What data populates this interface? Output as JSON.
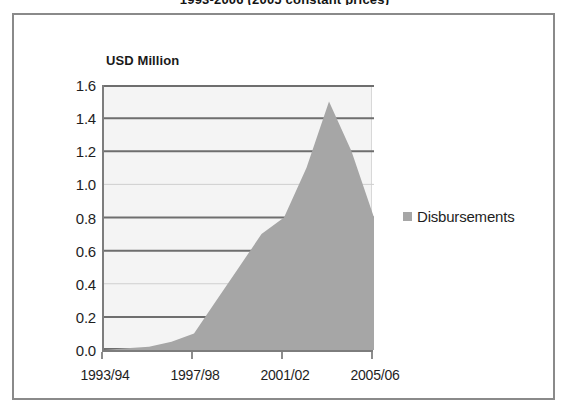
{
  "chart_data": {
    "type": "area",
    "title": "1993-2006 (2005 constant prices)",
    "ylabel": "USD Million",
    "xlabel": "",
    "ylim": [
      0.0,
      1.6
    ],
    "ytick_values": [
      1.6,
      1.4,
      1.2,
      1.0,
      0.8,
      0.6,
      0.4,
      0.2,
      0.0
    ],
    "ytick_labels": [
      "1.6",
      "1.4",
      "1.2",
      "1.0",
      "0.8",
      "0.6",
      "0.4",
      "0.2",
      "0.0"
    ],
    "grid": true,
    "legend_position": "right",
    "x": [
      "1993/94",
      "1994/95",
      "1995/96",
      "1996/97",
      "1997/98",
      "1998/99",
      "1999/00",
      "2000/01",
      "2001/02",
      "2002/03",
      "2003/04",
      "2004/05",
      "2005/06"
    ],
    "xtick_labels": [
      "1993/94",
      "1997/98",
      "2001/02",
      "2005/06"
    ],
    "xtick_indices": [
      0,
      4,
      8,
      12
    ],
    "series": [
      {
        "name": "Disbursements",
        "color": "#a6a6a6",
        "values": [
          0.0,
          0.01,
          0.02,
          0.05,
          0.1,
          0.3,
          0.5,
          0.7,
          0.8,
          1.1,
          1.5,
          1.2,
          0.8
        ]
      }
    ]
  },
  "legend": {
    "label": "Disbursements"
  },
  "colors": {
    "area_fill": "#a6a6a6",
    "plot_background": "#f4f4f4",
    "grid_major": "#6e6e6e",
    "grid_minor": "#cfcfcf",
    "axis": "#7d7d7d",
    "frame": "#8a8a8a",
    "text": "#1e1e1e"
  }
}
